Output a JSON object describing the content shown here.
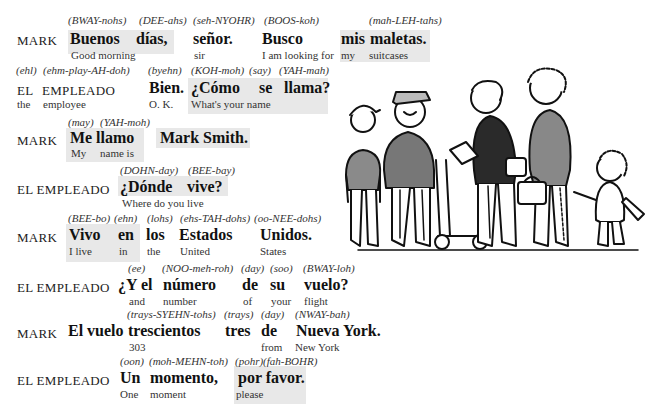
{
  "dialogue": {
    "lines": [
      {
        "speaker": "MARK",
        "pron": [
          "(BWAY-nohs)",
          "(DEE-ahs)",
          "(seh-NYOHR)",
          "(BOOS-koh)",
          "(mah-LEH-tahs)"
        ],
        "spanish": [
          "Buenos",
          "días,",
          "señor.",
          "Busco",
          "mis",
          "maletas."
        ],
        "english": [
          "Good morning",
          "sir",
          "I am looking for",
          "my",
          "suitcases"
        ]
      },
      {
        "speaker_es": [
          "EL",
          "EMPLEADO"
        ],
        "speaker_en": [
          "the",
          "employee"
        ],
        "pron": [
          "(ehl)",
          "(ehm-play-AH-doh)",
          "(byehn)",
          "(KOH-moh)",
          "(say)",
          "(YAH-mah)"
        ],
        "spanish": [
          "Bien.",
          "¿Cómo",
          "se",
          "llama?"
        ],
        "english": [
          "O. K.",
          "What's your name"
        ]
      },
      {
        "speaker": "MARK",
        "pron": [
          "(may)",
          "(YAH-moh)"
        ],
        "spanish": [
          "Me",
          "llamo",
          "Mark Smith."
        ],
        "english": [
          "My",
          "name is"
        ]
      },
      {
        "speaker": "EL EMPLEADO",
        "pron": [
          "(DOHN-day)",
          "(BEE-bay)"
        ],
        "spanish": [
          "¿Dónde",
          "vive?"
        ],
        "english": [
          "Where do you live"
        ]
      },
      {
        "speaker": "MARK",
        "pron": [
          "(BEE-bo)",
          "(ehn)",
          "(lohs)",
          "(ehs-TAH-dohs)",
          "(oo-NEE-dohs)"
        ],
        "spanish": [
          "Vivo",
          "en",
          "los",
          "Estados",
          "Unidos."
        ],
        "english": [
          "I live",
          "in",
          "the",
          "United",
          "States"
        ]
      },
      {
        "speaker": "EL EMPLEADO",
        "pron": [
          "(ee)",
          "(NOO-meh-roh)",
          "(day)",
          "(soo)",
          "(BWAY-loh)"
        ],
        "spanish": [
          "¿Y el",
          "número",
          "de",
          "su",
          "vuelo?"
        ],
        "english": [
          "and",
          "number",
          "of",
          "your",
          "flight"
        ]
      },
      {
        "speaker": "MARK",
        "pron": [
          "(trays-SYEHN-tohs)",
          "(trays)",
          "(day)",
          "(NWAY-bah)"
        ],
        "spanish": [
          "El vuelo",
          "trescientos",
          "tres",
          "de",
          "Nueva York."
        ],
        "english": [
          "303",
          "from",
          "New York"
        ]
      },
      {
        "speaker": "EL EMPLEADO",
        "pron": [
          "(oon)",
          "(moh-MEHN-toh)",
          "(pohr)",
          "(fah-BOHR)"
        ],
        "spanish": [
          "Un",
          "momento,",
          "por favor."
        ],
        "english": [
          "One",
          "moment",
          "please"
        ]
      }
    ]
  },
  "illustration": {
    "description": "line of travelers at airport counter: boy in cap, porter with luggage cart, man holding tickets, woman with bag, child with stuffed toy"
  }
}
